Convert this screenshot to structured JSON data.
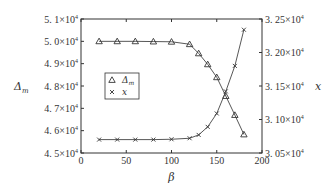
{
  "chart_data": {
    "type": "line",
    "title": "",
    "xlabel": "β",
    "ylabel_left": "Δm",
    "ylabel_right": "x",
    "xlim": [
      0,
      200
    ],
    "ylim_left": [
      45000,
      51000
    ],
    "ylim_right": [
      30500,
      32500
    ],
    "x_ticks": [
      "0",
      "50",
      "100",
      "150",
      "200"
    ],
    "y_ticks_left": [
      "4. 5×10⁴",
      "4. 6×10⁴",
      "4. 7×10⁴",
      "4. 8×10⁴",
      "4. 9×10⁴",
      "5. 0×10⁴",
      "5. 1×10⁴"
    ],
    "y_ticks_right": [
      "3. 05×10⁴",
      "3. 10×10⁴",
      "3. 15×10⁴",
      "3. 20×10⁴",
      "3. 25×10⁴"
    ],
    "grid": false,
    "legend_position": "inside-left-center",
    "x": [
      20,
      40,
      60,
      80,
      100,
      120,
      130,
      140,
      150,
      160,
      170,
      180
    ],
    "series": [
      {
        "name": "Δm",
        "axis": "left",
        "marker": "triangle",
        "values": [
          50000,
          50000,
          50000,
          49990,
          49980,
          49870,
          49460,
          48970,
          48390,
          47550,
          46700,
          45830
        ]
      },
      {
        "name": "x",
        "axis": "right",
        "marker": "cross",
        "values": [
          30700,
          30700,
          30700,
          30700,
          30705,
          30720,
          30770,
          30890,
          31090,
          31420,
          31800,
          32340
        ]
      }
    ]
  },
  "legend": {
    "items": [
      {
        "label": "Δm",
        "marker": "triangle"
      },
      {
        "label": "x",
        "marker": "cross"
      }
    ]
  },
  "labels": {
    "xlabel": "β",
    "ylabel_left": "Δm",
    "ylabel_right": "x"
  }
}
